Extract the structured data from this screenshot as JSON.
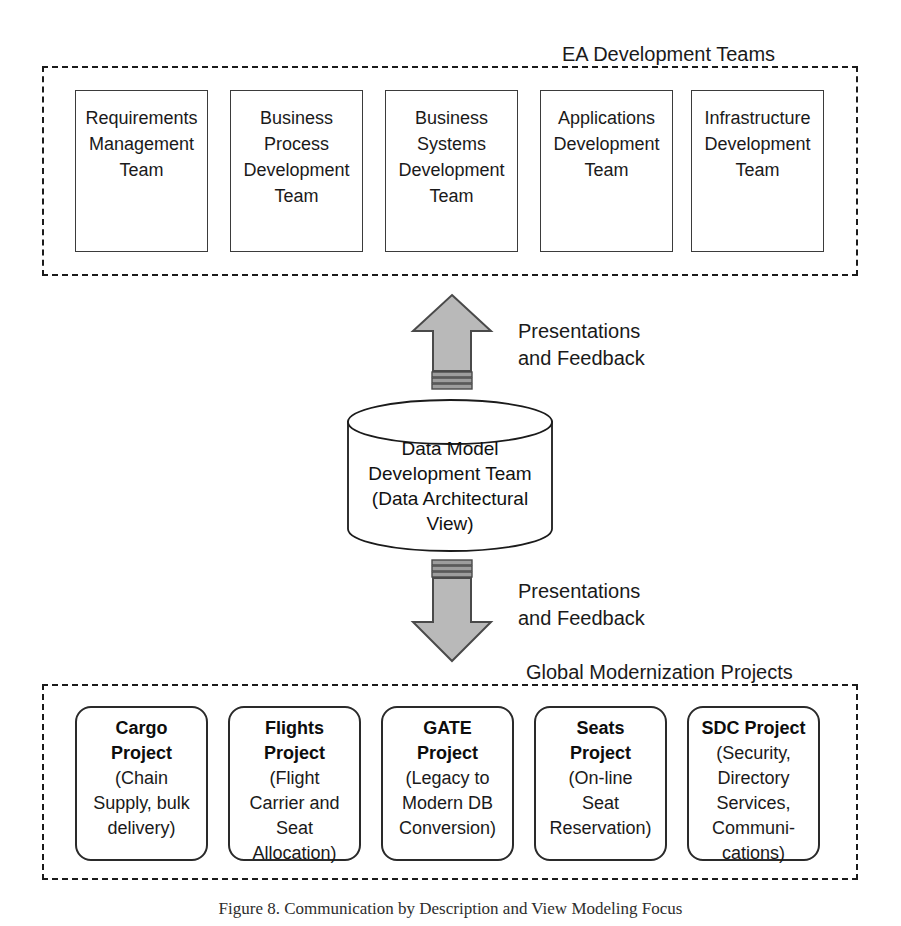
{
  "figure": {
    "caption": "Figure 8. Communication by Description and View Modeling Focus"
  },
  "top_group": {
    "label": "EA Development Teams",
    "teams": [
      {
        "name": "requirements-management-team",
        "text": "Requirements\nManagement\nTeam"
      },
      {
        "name": "business-process-development-team",
        "text": "Business\nProcess\nDevelopment\nTeam"
      },
      {
        "name": "business-systems-development-team",
        "text": "Business\nSystems\nDevelopment\nTeam"
      },
      {
        "name": "applications-development-team",
        "text": "Applications\nDevelopment\nTeam"
      },
      {
        "name": "infrastructure-development-team",
        "text": "Infrastructure\nDevelopment\nTeam"
      }
    ]
  },
  "center": {
    "label": "Data Model\nDevelopment Team\n(Data Architectural\nView)",
    "shape": "cylinder-database"
  },
  "flows": [
    {
      "name": "upward-flow-label",
      "direction": "up",
      "text": "Presentations\nand Feedback"
    },
    {
      "name": "downward-flow-label",
      "direction": "down",
      "text": "Presentations\nand Feedback"
    }
  ],
  "bottom_group": {
    "label": "Global Modernization Projects",
    "projects": [
      {
        "name": "cargo-project",
        "title": "Cargo\nProject",
        "desc": "(Chain\nSupply, bulk\ndelivery)"
      },
      {
        "name": "flights-project",
        "title": "Flights\nProject",
        "desc": "(Flight\nCarrier and\nSeat\nAllocation)"
      },
      {
        "name": "gate-project",
        "title": "GATE\nProject",
        "desc": "(Legacy to\nModern DB\nConversion)"
      },
      {
        "name": "seats-project",
        "title": "Seats\nProject",
        "desc": "(On-line\nSeat\nReservation)"
      },
      {
        "name": "sdc-project",
        "title": "SDC Project",
        "desc": "(Security,\nDirectory\nServices,\nCommuni-\ncations)"
      }
    ]
  },
  "colors": {
    "arrow_fill": "#b8b8b8",
    "arrow_stroke": "#4a4a4a",
    "stripe": "#6e6e6e",
    "line": "#1b1b1b",
    "background": "#ffffff"
  }
}
